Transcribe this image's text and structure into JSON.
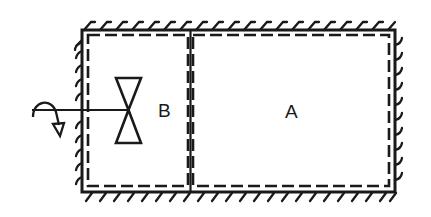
{
  "diagram": {
    "type": "two-compartment insulated vessel with valve",
    "compartments": [
      {
        "id": "B",
        "label": "B"
      },
      {
        "id": "A",
        "label": "A"
      }
    ],
    "labels": {
      "compartment_b": "B",
      "compartment_a": "A"
    },
    "components": [
      "rigid insulated walls (hatched)",
      "dashed system boundary",
      "partition wall",
      "valve",
      "valve handle rotation arrow"
    ],
    "colors": {
      "stroke": "#1a1a1a",
      "background": "#ffffff"
    }
  }
}
